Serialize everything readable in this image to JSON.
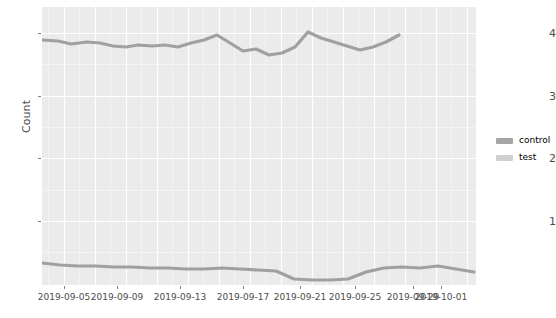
{
  "chart_data": {
    "type": "line",
    "title": "",
    "subtitle": "",
    "xlabel": "",
    "ylabel": "Count",
    "ylim": [
      0.25,
      4.45
    ],
    "yticks": [
      1,
      2,
      3,
      4
    ],
    "ytick_labels": [
      "1",
      "2",
      "3",
      "4"
    ],
    "grid": true,
    "grid_color": "#ffffff",
    "panel_color": "#ebebeb",
    "legend_position": "right",
    "xlim": [
      "2019-09-04",
      "2019-10-01"
    ],
    "xticks": [
      "2019-09-05",
      "2019-09-09",
      "2019-09-13",
      "2019-09-17",
      "2019-09-21",
      "2019-09-25",
      "2019-09-29",
      "2019-10-01"
    ],
    "xtick_labels": [
      "2019-09-05",
      "2019-09-09",
      "2019-09-13",
      "2019-09-17",
      "2019-09-21",
      "2019-09-25",
      "2019-09-29",
      "2019-10-01"
    ],
    "x": [
      "2019-09-04",
      "2019-09-05",
      "2019-09-06",
      "2019-09-07",
      "2019-09-08",
      "2019-09-09",
      "2019-09-10",
      "2019-09-11",
      "2019-09-12",
      "2019-09-13",
      "2019-09-14",
      "2019-09-15",
      "2019-09-16",
      "2019-09-17",
      "2019-09-18",
      "2019-09-19",
      "2019-09-20",
      "2019-09-21",
      "2019-09-22",
      "2019-09-23",
      "2019-09-24",
      "2019-09-25",
      "2019-09-26",
      "2019-09-27",
      "2019-09-28",
      "2019-09-29",
      "2019-09-30",
      "2019-10-01"
    ],
    "series": [
      {
        "name": "control",
        "color": "#b3b3b3",
        "values": [
          4.06,
          4.05,
          4.0,
          4.02,
          4.04,
          4.0,
          3.97,
          3.98,
          4.03,
          4.01,
          3.99,
          4.04,
          4.07,
          4.13,
          4.03,
          3.95,
          3.98,
          3.93,
          3.96,
          4.05,
          4.17,
          4.08,
          4.04,
          4.0,
          3.96,
          3.99,
          4.04,
          4.1
        ]
      },
      {
        "name": "test",
        "color": "#cccccc",
        "values": [
          3.88,
          3.86,
          3.85,
          3.87,
          3.86,
          3.85,
          3.86,
          3.85,
          3.84,
          3.85,
          3.84,
          3.84,
          3.85,
          3.84,
          3.83,
          3.84,
          3.85,
          3.84,
          3.85,
          3.86,
          3.88,
          3.9,
          3.92,
          3.94,
          3.96,
          3.98,
          4.0,
          4.03
        ]
      }
    ],
    "lines_rendered": [
      {
        "name": "control",
        "color": "#a0a0a0",
        "width": 3.2,
        "points": [
          [
            0,
            33
          ],
          [
            16,
            34
          ],
          [
            29,
            37
          ],
          [
            45,
            35
          ],
          [
            58,
            36
          ],
          [
            71,
            39
          ],
          [
            84,
            40
          ],
          [
            96,
            38
          ],
          [
            110,
            39
          ],
          [
            123,
            38
          ],
          [
            136,
            40
          ],
          [
            149,
            36
          ],
          [
            162,
            33
          ],
          [
            175,
            28
          ],
          [
            188,
            36
          ],
          [
            201,
            44
          ],
          [
            214,
            42
          ],
          [
            227,
            48
          ],
          [
            240,
            46
          ],
          [
            253,
            40
          ],
          [
            266,
            25
          ],
          [
            279,
            31
          ],
          [
            292,
            35
          ],
          [
            305,
            39
          ],
          [
            318,
            43
          ],
          [
            331,
            40
          ],
          [
            344,
            35
          ],
          [
            357,
            28
          ]
        ]
      },
      {
        "name": "test",
        "color": "#a0a0a0",
        "width": 3.2,
        "points": [
          [
            0,
            256
          ],
          [
            18,
            258
          ],
          [
            36,
            259
          ],
          [
            54,
            259
          ],
          [
            72,
            260
          ],
          [
            90,
            260
          ],
          [
            108,
            261
          ],
          [
            126,
            261
          ],
          [
            144,
            262
          ],
          [
            162,
            262
          ],
          [
            180,
            261
          ],
          [
            198,
            262
          ],
          [
            216,
            263
          ],
          [
            234,
            264
          ],
          [
            252,
            272
          ],
          [
            270,
            273
          ],
          [
            288,
            273
          ],
          [
            306,
            272
          ],
          [
            324,
            265
          ],
          [
            342,
            261
          ],
          [
            360,
            260
          ],
          [
            378,
            261
          ],
          [
            396,
            259
          ],
          [
            414,
            262
          ],
          [
            432,
            265
          ]
        ]
      }
    ]
  },
  "axes": {
    "ylabel": "Count",
    "ytick_labels": [
      "4",
      "3",
      "2",
      "1"
    ],
    "xtick_labels": [
      "2019-09-05",
      "2019-09-09",
      "2019-09-13",
      "2019-09-17",
      "2019-09-21",
      "2019-09-25",
      "2019-09-29",
      "2019-10-01"
    ]
  },
  "legend": {
    "items": [
      {
        "label": "control",
        "color": "#a6a6a6"
      },
      {
        "label": "test",
        "color": "#d0d0d0"
      }
    ]
  }
}
